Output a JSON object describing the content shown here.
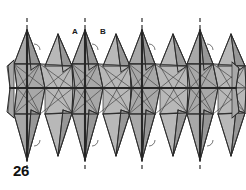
{
  "figure": {
    "number": "26",
    "type": "polyhedral-chain-diagram",
    "background_color": "#ffffff",
    "fill_color": "#a8a8a8",
    "fill_color_light": "#b8b8b8",
    "fill_color_dark": "#9a9a9a",
    "edge_color": "#2b2b2b",
    "thin_edge_color": "#3a3a3a",
    "dashed_axis_color": "#1a1a1a",
    "label_color": "#111111",
    "labels": [
      {
        "text": "A",
        "x": 75,
        "y": 33
      },
      {
        "text": "B",
        "x": 103,
        "y": 33
      }
    ],
    "axes": {
      "count": 4,
      "x_positions": [
        27,
        85,
        142,
        200
      ],
      "y_top": 18,
      "y_bottom": 172,
      "dash_pattern": "4 3",
      "stroke_width": 1.1
    },
    "band": {
      "center_y": 88,
      "top_y": 60,
      "bottom_y": 118,
      "left_x": 10,
      "right_x": 236,
      "repeat_period": 57.5
    },
    "spikes": {
      "top_count": 8,
      "bottom_count": 8,
      "top_apex_y": 30,
      "bottom_apex_y": 160
    },
    "angle_marks": {
      "count": 8,
      "radius": 5
    }
  }
}
